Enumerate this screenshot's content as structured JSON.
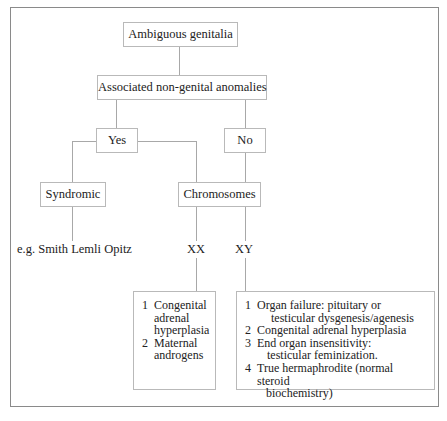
{
  "diagram": {
    "root": "Ambiguous genitalia",
    "question": "Associated non-genital anomalies",
    "yes": "Yes",
    "no": "No",
    "syndromic": "Syndromic",
    "chromosomes": "Chromosomes",
    "example": "e.g. Smith Lemli Opitz",
    "xx": "XX",
    "xy": "XY",
    "xx_causes": [
      {
        "num": "1",
        "text": "Congenital adrenal hyperplasia"
      },
      {
        "num": "2",
        "text": "Maternal androgens"
      }
    ],
    "xy_causes": [
      {
        "num": "1",
        "line1": "Organ failure: pituitary or",
        "line2": "testicular dysgenesis/agenesis"
      },
      {
        "num": "2",
        "line1": "Congenital adrenal hyperplasia"
      },
      {
        "num": "3",
        "line1": "End organ insensitivity:",
        "line2": "testicular feminization."
      },
      {
        "num": "4",
        "line1": "True hermaphrodite (normal steroid",
        "line2": "biochemistry)"
      }
    ]
  }
}
